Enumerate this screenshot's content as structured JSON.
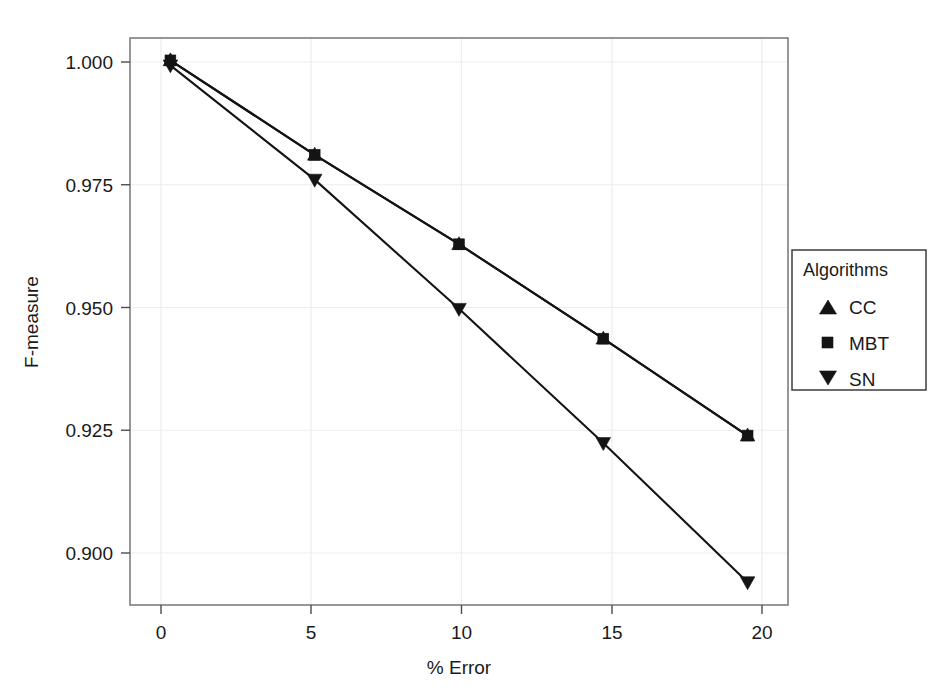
{
  "chart_data": {
    "type": "line",
    "title": "",
    "subtitle": "",
    "xlabel": "% Error",
    "ylabel": "F-measure",
    "x": [
      0,
      5,
      10,
      15,
      20
    ],
    "xtick_labels": [
      "0",
      "5",
      "10",
      "15",
      "20"
    ],
    "ytick_labels": [
      "0.900",
      "0.925",
      "0.950",
      "0.975",
      "1.000"
    ],
    "ytick_values": [
      0.9,
      0.925,
      0.95,
      0.975,
      1.0
    ],
    "xlim": [
      -1.4,
      21.4
    ],
    "ylim": [
      0.8894,
      1.0035
    ],
    "grid": true,
    "legend_position": "right",
    "legend_title": "Algorithms",
    "series": [
      {
        "name": "CC",
        "marker": "triangle-up",
        "values": [
          0.999,
          0.98,
          0.962,
          0.943,
          0.9235
        ]
      },
      {
        "name": "MBT",
        "marker": "square",
        "values": [
          0.999,
          0.98,
          0.962,
          0.943,
          0.9235
        ]
      },
      {
        "name": "SN",
        "marker": "triangle-down",
        "values": [
          0.998,
          0.975,
          0.949,
          0.922,
          0.894
        ]
      }
    ],
    "colors": {
      "series": "#141414",
      "grid": "#ededed",
      "panel_border": "#7d7d7d",
      "background": "#ffffff",
      "text": "#1a1a1a"
    }
  },
  "legend": {
    "title": "Algorithms",
    "entries": [
      {
        "label": "CC",
        "marker": "triangle-up-icon"
      },
      {
        "label": "MBT",
        "marker": "square-icon"
      },
      {
        "label": "SN",
        "marker": "triangle-down-icon"
      }
    ]
  },
  "axes": {
    "x_title": "% Error",
    "y_title": "F-measure",
    "x_ticks": [
      "0",
      "5",
      "10",
      "15",
      "20"
    ],
    "y_ticks": [
      "1.000",
      "0.975",
      "0.950",
      "0.925",
      "0.900"
    ]
  }
}
